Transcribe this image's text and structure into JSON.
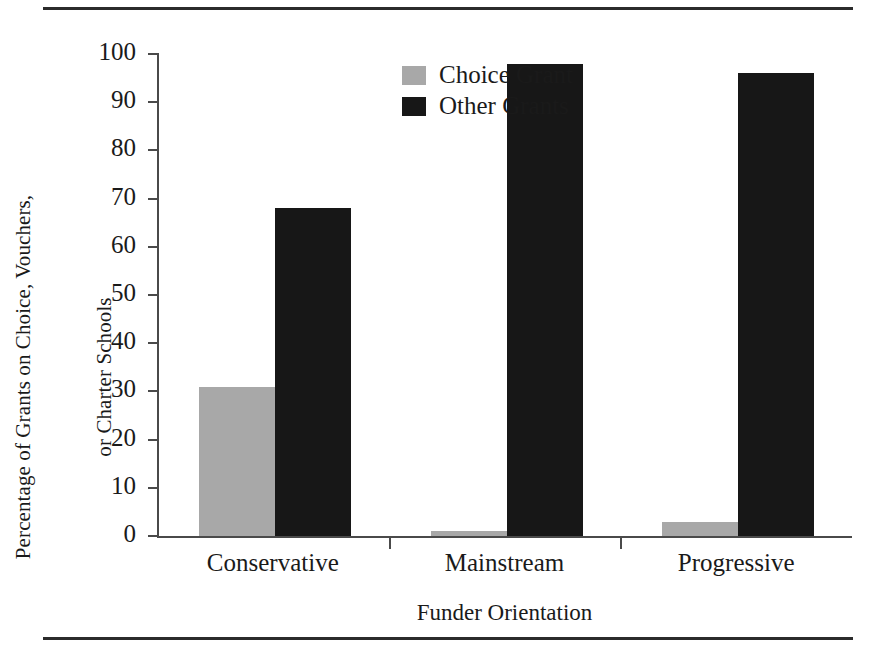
{
  "figure": {
    "top_rule": "horizontal-rule",
    "bottom_rule": "horizontal-rule"
  },
  "chart_data": {
    "type": "bar",
    "title": "",
    "subtitle": "",
    "xlabel": "Funder Orientation",
    "ylabel": "Percentage of Grants on Choice, Vouchers,\nor Charter Schools",
    "ylabel_line1": "Percentage of Grants on Choice, Vouchers,",
    "ylabel_line2": "or Charter Schools",
    "categories": [
      "Conservative",
      "Mainstream",
      "Progressive"
    ],
    "series": [
      {
        "name": "Choice Grant",
        "color": "#a8a8a8",
        "values": [
          31,
          1,
          3
        ]
      },
      {
        "name": "Other Grants",
        "color": "#171717",
        "values": [
          68,
          98,
          96
        ]
      }
    ],
    "ylim": [
      0,
      100
    ],
    "yticks": [
      0,
      10,
      20,
      30,
      40,
      50,
      60,
      70,
      80,
      90,
      100
    ],
    "ytick_labels": [
      "0",
      "10",
      "20",
      "30",
      "40",
      "50",
      "60",
      "70",
      "80",
      "90",
      "100"
    ],
    "grid": false,
    "legend_position": "top-left-inside",
    "legend": [
      "Choice Grant",
      "Other Grants"
    ]
  }
}
